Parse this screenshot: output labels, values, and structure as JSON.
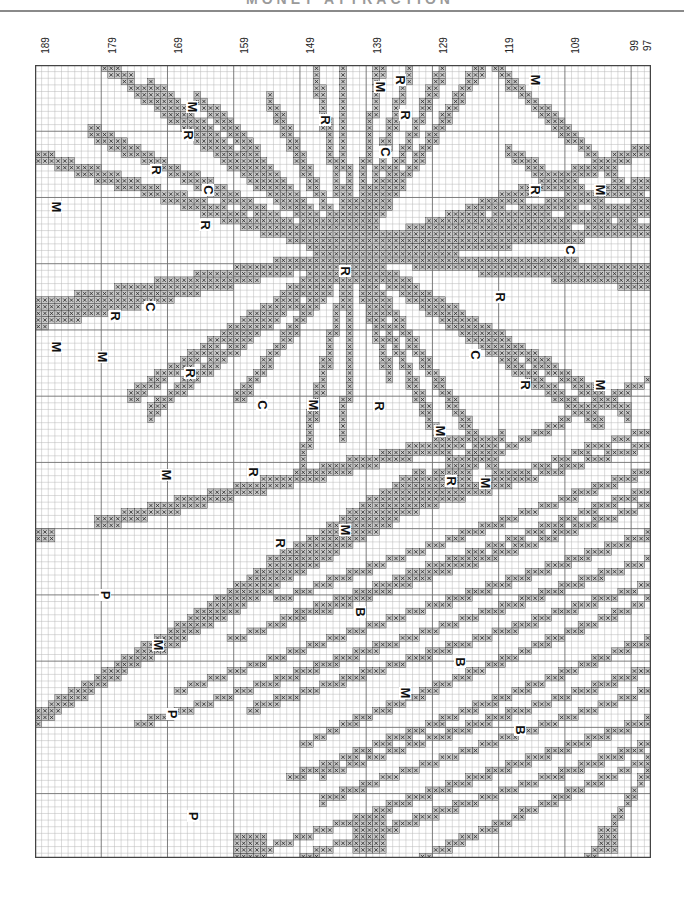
{
  "page": {
    "title": "MONET ATTRACTION",
    "type": "cross-stitch chart"
  },
  "grid": {
    "columns": 93,
    "rows": 120,
    "cell_px": 6.62,
    "origin": [
      35,
      65
    ],
    "size": [
      616,
      793
    ],
    "major_every": 10,
    "colors": {
      "paper": "#ffffff",
      "minor_line": "#b8b8b8",
      "major_line": "#6e6e6e",
      "stitch_fill": "#c8c8c8",
      "stitch_mark": "#2a2a2a",
      "outline": "#1a1a1a",
      "border": "#444444"
    }
  },
  "column_numbers": [
    {
      "label": "189",
      "x": 45
    },
    {
      "label": "179",
      "x": 112
    },
    {
      "label": "169",
      "x": 178
    },
    {
      "label": "159",
      "x": 244
    },
    {
      "label": "149",
      "x": 310
    },
    {
      "label": "139",
      "x": 377
    },
    {
      "label": "129",
      "x": 443
    },
    {
      "label": "119",
      "x": 509
    },
    {
      "label": "109",
      "x": 575
    },
    {
      "label": "99",
      "x": 634
    },
    {
      "label": "97",
      "x": 647
    }
  ],
  "legend_keys": [
    "M",
    "R",
    "C",
    "P",
    "B"
  ],
  "labels": [
    {
      "t": "M",
      "x": 56,
      "y": 142
    },
    {
      "t": "M",
      "x": 192,
      "y": 42
    },
    {
      "t": "M",
      "x": 56,
      "y": 282
    },
    {
      "t": "R",
      "x": 156,
      "y": 105
    },
    {
      "t": "R",
      "x": 188,
      "y": 70
    },
    {
      "t": "C",
      "x": 208,
      "y": 125
    },
    {
      "t": "R",
      "x": 205,
      "y": 160
    },
    {
      "t": "R",
      "x": 115,
      "y": 251
    },
    {
      "t": "C",
      "x": 150,
      "y": 242
    },
    {
      "t": "R",
      "x": 325,
      "y": 55
    },
    {
      "t": "M",
      "x": 380,
      "y": 22
    },
    {
      "t": "R",
      "x": 405,
      "y": 50
    },
    {
      "t": "C",
      "x": 385,
      "y": 87
    },
    {
      "t": "R",
      "x": 400,
      "y": 15
    },
    {
      "t": "M",
      "x": 535,
      "y": 15
    },
    {
      "t": "R",
      "x": 535,
      "y": 125
    },
    {
      "t": "M",
      "x": 600,
      "y": 125
    },
    {
      "t": "C",
      "x": 570,
      "y": 185
    },
    {
      "t": "R",
      "x": 500,
      "y": 232
    },
    {
      "t": "R",
      "x": 345,
      "y": 206
    },
    {
      "t": "M",
      "x": 102,
      "y": 292
    },
    {
      "t": "R",
      "x": 190,
      "y": 308
    },
    {
      "t": "C",
      "x": 262,
      "y": 340
    },
    {
      "t": "M",
      "x": 313,
      "y": 340
    },
    {
      "t": "R",
      "x": 379,
      "y": 341
    },
    {
      "t": "M",
      "x": 440,
      "y": 366
    },
    {
      "t": "C",
      "x": 475,
      "y": 290
    },
    {
      "t": "R",
      "x": 525,
      "y": 320
    },
    {
      "t": "M",
      "x": 600,
      "y": 320
    },
    {
      "t": "M",
      "x": 166,
      "y": 410
    },
    {
      "t": "R",
      "x": 253,
      "y": 407
    },
    {
      "t": "R",
      "x": 451,
      "y": 416
    },
    {
      "t": "M",
      "x": 485,
      "y": 418
    },
    {
      "t": "M",
      "x": 345,
      "y": 465
    },
    {
      "t": "R",
      "x": 280,
      "y": 478
    },
    {
      "t": "P",
      "x": 105,
      "y": 530
    },
    {
      "t": "B",
      "x": 360,
      "y": 547
    },
    {
      "t": "M",
      "x": 158,
      "y": 580
    },
    {
      "t": "B",
      "x": 460,
      "y": 597
    },
    {
      "t": "M",
      "x": 405,
      "y": 628
    },
    {
      "t": "P",
      "x": 172,
      "y": 649
    },
    {
      "t": "B",
      "x": 520,
      "y": 665
    },
    {
      "t": "P",
      "x": 193,
      "y": 751
    },
    {
      "t": "M",
      "x": 311,
      "y": 844
    },
    {
      "t": "M",
      "x": 393,
      "y": 810
    },
    {
      "t": "B",
      "x": 444,
      "y": 826
    },
    {
      "t": "M",
      "x": 575,
      "y": 834
    }
  ],
  "rays": [
    {
      "from": [
        352,
        251
      ],
      "to": [
        90,
        128
      ],
      "w": 2
    },
    {
      "from": [
        352,
        251
      ],
      "to": [
        30,
        150
      ],
      "w": 2
    },
    {
      "from": [
        352,
        251
      ],
      "to": [
        105,
        60
      ],
      "w": 2
    },
    {
      "from": [
        352,
        251
      ],
      "to": [
        150,
        80
      ],
      "w": 2
    },
    {
      "from": [
        352,
        251
      ],
      "to": [
        200,
        95
      ],
      "w": 2
    },
    {
      "from": [
        352,
        251
      ],
      "to": [
        270,
        98
      ],
      "w": 2
    },
    {
      "from": [
        352,
        251
      ],
      "to": [
        315,
        65
      ],
      "w": 2
    },
    {
      "from": [
        352,
        251
      ],
      "to": [
        340,
        65
      ],
      "w": 2
    },
    {
      "from": [
        352,
        251
      ],
      "to": [
        380,
        65
      ],
      "w": 2
    },
    {
      "from": [
        352,
        251
      ],
      "to": [
        410,
        65
      ],
      "w": 2
    },
    {
      "from": [
        352,
        251
      ],
      "to": [
        445,
        65
      ],
      "w": 2
    },
    {
      "from": [
        352,
        251
      ],
      "to": [
        480,
        65
      ],
      "w": 2
    },
    {
      "from": [
        352,
        251
      ],
      "to": [
        650,
        205
      ],
      "w": 2
    },
    {
      "from": [
        352,
        251
      ],
      "to": [
        650,
        180
      ],
      "w": 2
    },
    {
      "from": [
        352,
        251
      ],
      "to": [
        650,
        145
      ],
      "w": 2
    },
    {
      "from": [
        352,
        251
      ],
      "to": [
        650,
        225
      ],
      "w": 2
    },
    {
      "from": [
        352,
        251
      ],
      "to": [
        650,
        268
      ],
      "w": 2
    },
    {
      "from": [
        352,
        251
      ],
      "to": [
        650,
        280
      ],
      "w": 2
    },
    {
      "from": [
        352,
        251
      ],
      "to": [
        630,
        410
      ],
      "w": 2
    },
    {
      "from": [
        352,
        251
      ],
      "to": [
        600,
        420
      ],
      "w": 2
    },
    {
      "from": [
        352,
        251
      ],
      "to": [
        500,
        470
      ],
      "w": 2
    },
    {
      "from": [
        352,
        251
      ],
      "to": [
        460,
        480
      ],
      "w": 2
    },
    {
      "from": [
        352,
        251
      ],
      "to": [
        390,
        370
      ],
      "w": 2
    },
    {
      "from": [
        352,
        251
      ],
      "to": [
        30,
        320
      ],
      "w": 2
    },
    {
      "from": [
        352,
        251
      ],
      "to": [
        30,
        305
      ],
      "w": 2
    },
    {
      "from": [
        352,
        251
      ],
      "to": [
        150,
        410
      ],
      "w": 2
    },
    {
      "from": [
        352,
        251
      ],
      "to": [
        130,
        395
      ],
      "w": 2
    },
    {
      "from": [
        352,
        251
      ],
      "to": [
        240,
        395
      ],
      "w": 2
    },
    {
      "from": [
        352,
        251
      ],
      "to": [
        300,
        470
      ],
      "w": 2
    },
    {
      "from": [
        352,
        251
      ],
      "to": [
        345,
        430
      ],
      "w": 2
    },
    {
      "from": [
        650,
        205
      ],
      "to": [
        470,
        40
      ],
      "w": 2
    },
    {
      "from": [
        650,
        230
      ],
      "to": [
        510,
        150
      ],
      "w": 2
    },
    {
      "from": [
        470,
        435
      ],
      "to": [
        100,
        520
      ],
      "w": 2
    },
    {
      "from": [
        500,
        435
      ],
      "to": [
        30,
        720
      ],
      "w": 2
    },
    {
      "from": [
        470,
        470
      ],
      "to": [
        50,
        705
      ],
      "w": 2
    },
    {
      "from": [
        420,
        470
      ],
      "to": [
        80,
        690
      ],
      "w": 2
    },
    {
      "from": [
        650,
        380
      ],
      "to": [
        270,
        560
      ],
      "w": 1
    },
    {
      "from": [
        650,
        430
      ],
      "to": [
        310,
        540
      ],
      "w": 1
    },
    {
      "from": [
        650,
        445
      ],
      "to": [
        330,
        532
      ],
      "w": 1
    },
    {
      "from": [
        650,
        470
      ],
      "to": [
        280,
        600
      ],
      "w": 1
    },
    {
      "from": [
        650,
        490
      ],
      "to": [
        270,
        625
      ],
      "w": 1
    },
    {
      "from": [
        650,
        505
      ],
      "to": [
        230,
        640
      ],
      "w": 1
    },
    {
      "from": [
        650,
        535
      ],
      "to": [
        180,
        690
      ],
      "w": 1
    },
    {
      "from": [
        650,
        560
      ],
      "to": [
        140,
        725
      ],
      "w": 1
    },
    {
      "from": [
        650,
        585
      ],
      "to": [
        250,
        710
      ],
      "w": 1
    },
    {
      "from": [
        650,
        600
      ],
      "to": [
        300,
        745
      ],
      "w": 1
    },
    {
      "from": [
        650,
        640
      ],
      "to": [
        290,
        780
      ],
      "w": 1
    },
    {
      "from": [
        650,
        670
      ],
      "to": [
        320,
        775
      ],
      "w": 1
    },
    {
      "from": [
        650,
        690
      ],
      "to": [
        320,
        801
      ],
      "w": 1
    },
    {
      "from": [
        650,
        720
      ],
      "to": [
        240,
        858
      ],
      "w": 1
    },
    {
      "from": [
        650,
        745
      ],
      "to": [
        300,
        858
      ],
      "w": 1
    },
    {
      "from": [
        650,
        760
      ],
      "to": [
        420,
        858
      ],
      "w": 1
    },
    {
      "from": [
        650,
        770
      ],
      "to": [
        590,
        858
      ],
      "w": 1
    }
  ],
  "blocks": [
    {
      "x": 338,
      "y": 222,
      "w": 32,
      "h": 50
    },
    {
      "x": 322,
      "y": 232,
      "w": 64,
      "h": 28
    },
    {
      "x": 30,
      "y": 532,
      "w": 26,
      "h": 12
    },
    {
      "x": 240,
      "y": 834,
      "w": 35,
      "h": 24
    },
    {
      "x": 355,
      "y": 820,
      "w": 30,
      "h": 38
    },
    {
      "x": 600,
      "y": 830,
      "w": 22,
      "h": 28
    }
  ]
}
